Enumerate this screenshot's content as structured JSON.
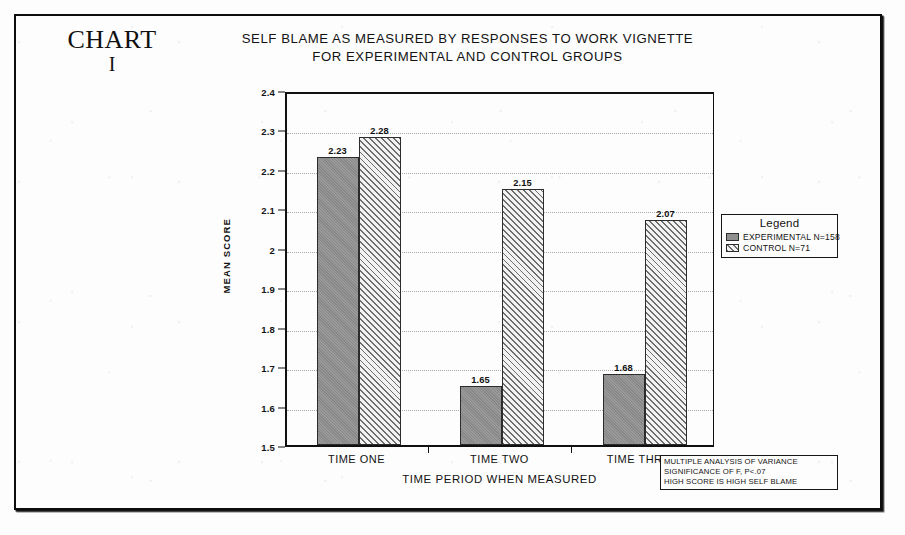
{
  "chart_number": {
    "word": "CHART",
    "numeral": "I"
  },
  "chart_data": {
    "type": "bar",
    "title": "SELF BLAME AS MEASURED BY RESPONSES TO WORK VIGNETTE FOR EXPERIMENTAL AND CONTROL GROUPS",
    "title_lines": [
      "SELF BLAME AS MEASURED BY RESPONSES TO WORK VIGNETTE",
      "FOR EXPERIMENTAL AND CONTROL GROUPS"
    ],
    "xlabel": "TIME PERIOD WHEN MEASURED",
    "ylabel": "MEAN SCORE",
    "categories": [
      "TIME ONE",
      "TIME TWO",
      "TIME THREE"
    ],
    "series": [
      {
        "name": "EXPERIMENTAL N=158",
        "key": "experimental",
        "values": [
          2.23,
          2.28,
          1.65
        ]
      },
      {
        "name": "CONTROL N=71",
        "key": "control",
        "values": [
          2.28,
          2.15,
          2.07
        ]
      }
    ],
    "grouped_values": [
      {
        "category": "TIME ONE",
        "experimental": 2.23,
        "control": 2.28
      },
      {
        "category": "TIME TWO",
        "experimental": 1.65,
        "control": 2.15
      },
      {
        "category": "TIME THREE",
        "experimental": 1.68,
        "control": 2.07
      }
    ],
    "bar_labels": [
      "2.23",
      "2.28",
      "1.65",
      "2.15",
      "1.68",
      "2.07"
    ],
    "ylim": [
      1.5,
      2.4
    ],
    "ytick_values": [
      1.5,
      1.6,
      1.7,
      1.8,
      1.9,
      2.0,
      2.1,
      2.2,
      2.3,
      2.4
    ],
    "ytick_labels": [
      "1.5",
      "1.6",
      "1.7",
      "1.8",
      "1.9",
      "2",
      "2.1",
      "2.2",
      "2.3",
      "2.4"
    ],
    "grid": "horizontal-dotted",
    "legend_position": "right-outside",
    "colors": {
      "experimental_fill": "#8f8f8f",
      "control_fill": "#f2f2f2",
      "control_hatch": "#6d6d6d",
      "axis": "#101010",
      "gridline": "#a9a9a9",
      "paper": "#fdfdfd"
    }
  },
  "legend": {
    "title": "Legend",
    "entries": [
      {
        "label": "EXPERIMENTAL N=158",
        "key": "experimental"
      },
      {
        "label": "CONTROL N=71",
        "key": "control"
      }
    ]
  },
  "footnote": {
    "lines": [
      "MULTIPLE ANALYSIS OF VARIANCE",
      "SIGNIFICANCE OF F, P<.07",
      "HIGH SCORE IS HIGH SELF BLAME"
    ]
  }
}
